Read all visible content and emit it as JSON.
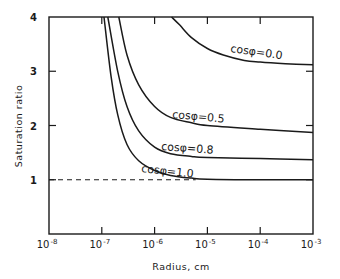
{
  "chart_data": {
    "type": "line",
    "title": "",
    "xlabel": "Radius, cm",
    "ylabel": "Saturation ratio",
    "xscale": "log",
    "xlim": [
      1e-08,
      0.001
    ],
    "ylim": [
      0,
      4
    ],
    "x_ticks": [
      1e-08,
      1e-07,
      1e-06,
      1e-05,
      0.0001,
      0.001
    ],
    "x_tick_labels": [
      {
        "base": "10",
        "exp": "-8"
      },
      {
        "base": "10",
        "exp": "-7"
      },
      {
        "base": "10",
        "exp": "-6"
      },
      {
        "base": "10",
        "exp": "-5"
      },
      {
        "base": "10",
        "exp": "-4"
      },
      {
        "base": "10",
        "exp": "-3"
      }
    ],
    "y_ticks": [
      1,
      2,
      3,
      4
    ],
    "y_tick_labels": [
      "1",
      "2",
      "3",
      "4"
    ],
    "grid": false,
    "legend": "inline labels on curves",
    "reference_line": {
      "y": 1.0,
      "style": "dashed"
    },
    "series": [
      {
        "name": "cos φ = 0.0",
        "label": "cosφ=0.0",
        "x": [
          2.1e-06,
          3e-06,
          5e-06,
          1e-05,
          2e-05,
          5e-05,
          0.0001,
          0.0003,
          0.001
        ],
        "y": [
          4.0,
          3.85,
          3.62,
          3.42,
          3.3,
          3.2,
          3.17,
          3.14,
          3.12
        ]
      },
      {
        "name": "cos φ = 0.5",
        "label": "cosφ=0.5",
        "x": [
          2.1e-07,
          3e-07,
          5e-07,
          1e-06,
          2e-06,
          5e-06,
          1e-05,
          0.0001,
          0.001
        ],
        "y": [
          4.0,
          3.3,
          2.75,
          2.35,
          2.15,
          2.05,
          2.0,
          1.93,
          1.87
        ]
      },
      {
        "name": "cos φ = 0.8",
        "label": "cosφ=0.8",
        "x": [
          1.3e-07,
          2e-07,
          3e-07,
          5e-07,
          1e-06,
          2e-06,
          5e-06,
          1e-05,
          0.0001,
          0.001
        ],
        "y": [
          4.0,
          3.0,
          2.35,
          1.9,
          1.6,
          1.48,
          1.43,
          1.41,
          1.39,
          1.37
        ]
      },
      {
        "name": "cos φ = 1.0",
        "label": "cosφ=1.0",
        "x": [
          1.1e-07,
          1.5e-07,
          2e-07,
          3e-07,
          5e-07,
          1e-06,
          2e-06,
          5e-06,
          1e-05,
          0.0001,
          0.001
        ],
        "y": [
          4.0,
          2.9,
          2.2,
          1.65,
          1.35,
          1.17,
          1.08,
          1.03,
          1.01,
          1.0,
          1.0
        ]
      }
    ]
  }
}
